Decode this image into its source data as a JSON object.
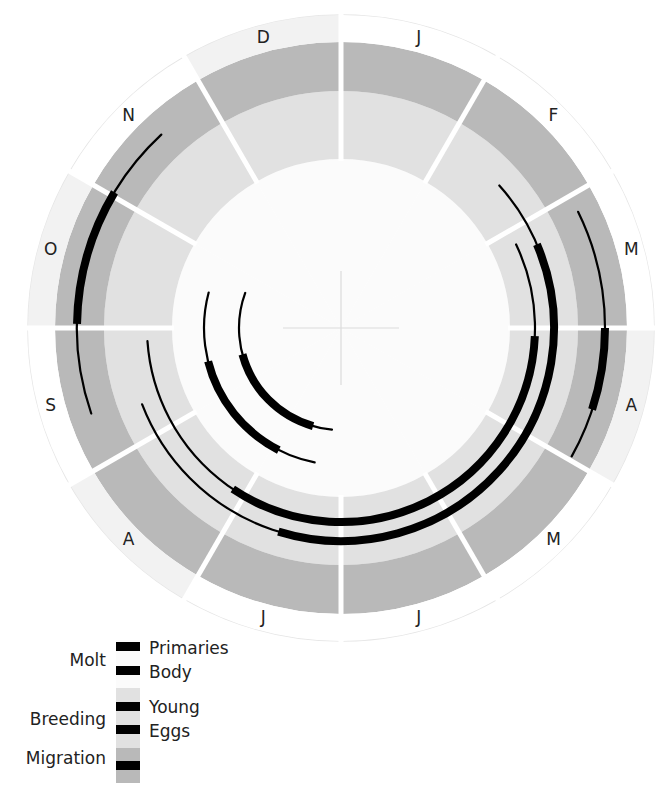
{
  "chart_data": {
    "type": "radial-timeline",
    "title": "",
    "months": [
      "J",
      "F",
      "M",
      "A",
      "M",
      "J",
      "J",
      "A",
      "S",
      "O",
      "N",
      "D"
    ],
    "start_month_at_top": "January",
    "direction": "clockwise",
    "units": "months from Jan 1 (0-12)",
    "rings": [
      {
        "name": "Molt",
        "fill": "#fbfbfb"
      },
      {
        "name": "Breeding",
        "fill": "#e1e1e1"
      },
      {
        "name": "Migration",
        "fill": "#b9b9b9"
      },
      {
        "name": "Month labels",
        "fill": "#ffffff"
      }
    ],
    "label_ring_shaded_months": [
      3,
      7,
      9,
      11
    ],
    "label_ring_shade": "#f2f2f2",
    "series": [
      {
        "name": "Primaries",
        "group": "Molt",
        "ring": "Molt",
        "range": [
          6.17,
          9.67
        ],
        "peak": [
          6.53,
          8.5
        ]
      },
      {
        "name": "Body",
        "group": "Molt",
        "ring": "Molt",
        "range": [
          6.37,
          9.5
        ],
        "peak": [
          6.9,
          8.53
        ]
      },
      {
        "name": "Young",
        "group": "Breeding",
        "ring": "Breeding",
        "range": [
          2.15,
          8.87
        ],
        "peak": [
          3.08,
          7.13
        ]
      },
      {
        "name": "Eggs",
        "group": "Breeding",
        "ring": "Breeding",
        "range": [
          1.6,
          8.3
        ],
        "peak": [
          2.23,
          6.57
        ]
      },
      {
        "name": "Spring migration",
        "group": "Migration",
        "ring": "Migration",
        "range": [
          2.13,
          3.97
        ],
        "peak": [
          3.0,
          3.6
        ]
      },
      {
        "name": "Fall migration",
        "group": "Migration",
        "ring": "Migration",
        "range": [
          8.37,
          10.57
        ],
        "peak": [
          9.03,
          10.03
        ]
      }
    ],
    "legend": {
      "placement": "bottom-left",
      "groups": [
        {
          "label": "Molt",
          "items": [
            "Primaries",
            "Body"
          ]
        },
        {
          "label": "Breeding",
          "items": [
            "Young",
            "Eggs"
          ]
        },
        {
          "label": "Migration",
          "items": []
        }
      ],
      "line_color": "#000000"
    }
  }
}
